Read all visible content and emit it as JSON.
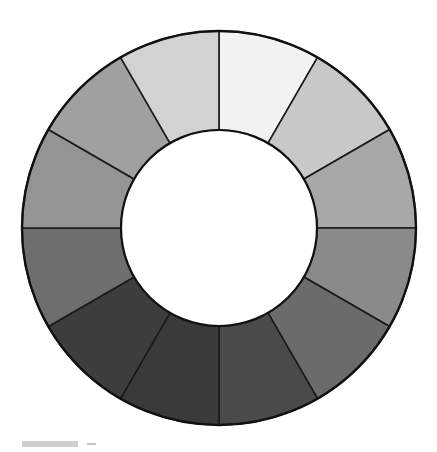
{
  "figure": {
    "background_color": "#ffffff",
    "outline_color": "#1a1a1a",
    "hub_color": "#ffffff",
    "center_x": 219,
    "center_y": 228,
    "outer_radius": 197,
    "inner_radius": 98,
    "segment_count": 12,
    "start_angle_deg": -90,
    "segment_span_deg": 30
  },
  "caption": {
    "scale_bar_label": "",
    "scale_bar_color": "#cfcfcf",
    "tick_color": "#c4c4c4"
  },
  "chart_data": {
    "type": "pie",
    "subtitle": "",
    "xlabel": "",
    "ylabel": "",
    "legend_position": "none",
    "grid": false,
    "hole_ratio": 0.497,
    "categories": [
      "segment-1",
      "segment-2",
      "segment-3",
      "segment-4",
      "segment-5",
      "segment-6",
      "segment-7",
      "segment-8",
      "segment-9",
      "segment-10",
      "segment-11",
      "segment-12"
    ],
    "values": [
      30,
      30,
      30,
      30,
      30,
      30,
      30,
      30,
      30,
      30,
      30,
      30
    ],
    "slices": [
      {
        "index": 1,
        "label": "segment-1",
        "position_oclock": "12-1",
        "start_angle_deg": -90,
        "end_angle_deg": -60,
        "value": 30,
        "color": "#f2f2f2",
        "value_step": 1,
        "lightness_rank": 1
      },
      {
        "index": 2,
        "label": "segment-2",
        "position_oclock": "1-2",
        "start_angle_deg": -60,
        "end_angle_deg": -30,
        "value": 30,
        "color": "#c8c8c8",
        "value_step": 2,
        "lightness_rank": 3
      },
      {
        "index": 3,
        "label": "segment-3",
        "position_oclock": "2-3",
        "start_angle_deg": -30,
        "end_angle_deg": 0,
        "value": 30,
        "color": "#a8a8a8",
        "value_step": 3,
        "lightness_rank": 5
      },
      {
        "index": 4,
        "label": "segment-4",
        "position_oclock": "3-4",
        "start_angle_deg": 0,
        "end_angle_deg": 30,
        "value": 30,
        "color": "#8a8a8a",
        "value_step": 4,
        "lightness_rank": 8
      },
      {
        "index": 5,
        "label": "segment-5",
        "position_oclock": "4-5",
        "start_angle_deg": 30,
        "end_angle_deg": 60,
        "value": 30,
        "color": "#6b6b6b",
        "value_step": 5,
        "lightness_rank": 9
      },
      {
        "index": 6,
        "label": "segment-6",
        "position_oclock": "5-6",
        "start_angle_deg": 60,
        "end_angle_deg": 90,
        "value": 30,
        "color": "#4a4a4a",
        "value_step": 6,
        "lightness_rank": 11
      },
      {
        "index": 7,
        "label": "segment-7",
        "position_oclock": "6-7",
        "start_angle_deg": 90,
        "end_angle_deg": 120,
        "value": 30,
        "color": "#3a3a3a",
        "value_step": 7,
        "lightness_rank": 12
      },
      {
        "index": 8,
        "label": "segment-8",
        "position_oclock": "7-8",
        "start_angle_deg": 120,
        "end_angle_deg": 150,
        "value": 30,
        "color": "#3d3d3d",
        "value_step": 8,
        "lightness_rank": 10
      },
      {
        "index": 9,
        "label": "segment-9",
        "position_oclock": "8-9",
        "start_angle_deg": 150,
        "end_angle_deg": 180,
        "value": 30,
        "color": "#6e6e6e",
        "value_step": 9,
        "lightness_rank": 7
      },
      {
        "index": 10,
        "label": "segment-10",
        "position_oclock": "9-10",
        "start_angle_deg": 180,
        "end_angle_deg": 210,
        "value": 30,
        "color": "#949494",
        "value_step": 10,
        "lightness_rank": 6
      },
      {
        "index": 11,
        "label": "segment-11",
        "position_oclock": "10-11",
        "start_angle_deg": 210,
        "end_angle_deg": 240,
        "value": 30,
        "color": "#a0a0a0",
        "value_step": 11,
        "lightness_rank": 4
      },
      {
        "index": 12,
        "label": "segment-12",
        "position_oclock": "11-12",
        "start_angle_deg": 240,
        "end_angle_deg": 270,
        "value": 30,
        "color": "#d2d2d2",
        "value_step": 12,
        "lightness_rank": 2
      }
    ]
  }
}
